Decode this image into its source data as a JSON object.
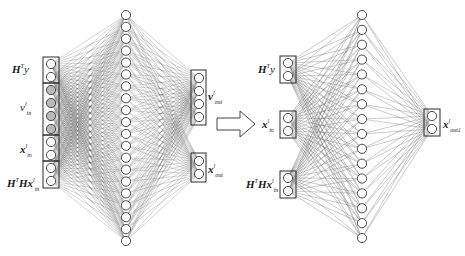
{
  "diagram": {
    "type": "neural-network-transformation",
    "left_network": {
      "input_groups": [
        {
          "label_main": "H",
          "label_sup": "T",
          "label_rest": "y",
          "nodes": 2,
          "fill": "#ffffff"
        },
        {
          "label_main": "v",
          "label_sup": "l",
          "label_sub": "in",
          "nodes": 4,
          "fill": "#b9b9b9"
        },
        {
          "label_main": "x",
          "label_sup": "l",
          "label_sub": "in",
          "nodes": 2,
          "fill": "#ffffff"
        },
        {
          "label_main": "H",
          "label_sup": "T",
          "label_rest": "Hx",
          "label_sup2": "l",
          "label_sub": "in",
          "nodes": 2,
          "fill": "#ffffff"
        }
      ],
      "hidden_nodes": 20,
      "output_groups": [
        {
          "label_main": "v",
          "label_sup": "l",
          "label_sub": "out",
          "nodes": 4
        },
        {
          "label_main": "x",
          "label_sup": "l",
          "label_sub": "out",
          "nodes": 2
        }
      ]
    },
    "arrow": {
      "direction": "right",
      "style": "hollow"
    },
    "right_network": {
      "input_groups": [
        {
          "label_main": "H",
          "label_sup": "T",
          "label_rest": "y",
          "nodes": 2
        },
        {
          "label_main": "x",
          "label_sup": "l",
          "label_sub": "in",
          "nodes": 2
        },
        {
          "label_main": "H",
          "label_sup": "T",
          "label_rest": "Hx",
          "label_sup2": "l",
          "label_sub": "in",
          "nodes": 2
        }
      ],
      "hidden_nodes": 16,
      "output_groups": [
        {
          "label_main": "x",
          "label_sup": "l",
          "label_sub": "out",
          "nodes": 2
        }
      ]
    },
    "labels": {
      "left_in_1": "y",
      "left_in_1_H": "H",
      "left_in_1_T": "T",
      "left_in_2_v": "v",
      "left_in_2_sup": "l",
      "left_in_2_sub": "in",
      "left_in_3_x": "x",
      "left_in_3_sup": "l",
      "left_in_3_sub": "in",
      "left_in_4_H": "H",
      "left_in_4_T": "T",
      "left_in_4_Hx": "Hx",
      "left_in_4_sup": "l",
      "left_in_4_sub": "in",
      "left_out_1_v": "v",
      "left_out_1_sup": "l",
      "left_out_1_sub": "out",
      "left_out_2_x": "x",
      "left_out_2_sup": "l",
      "left_out_2_sub": "out",
      "right_in_1_H": "H",
      "right_in_1_T": "T",
      "right_in_1": "y",
      "right_in_2_x": "x",
      "right_in_2_sup": "l",
      "right_in_2_sub": "in",
      "right_in_3_H": "H",
      "right_in_3_T": "T",
      "right_in_3_Hx": "Hx",
      "right_in_3_sup": "l",
      "right_in_3_sub": "in",
      "right_out_x": "x",
      "right_out_sup": "l",
      "right_out_sub": "out1"
    },
    "colors": {
      "edge": "#555555",
      "node_stroke": "#3a3a3a",
      "node_fill": "#ffffff",
      "highlight_fill": "#b9b9b9",
      "box_stroke": "#2a2a2a"
    }
  }
}
